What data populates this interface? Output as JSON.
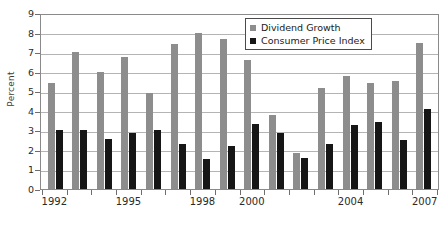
{
  "chart_data": {
    "type": "bar",
    "title": "",
    "xlabel": "",
    "ylabel": "Percent",
    "ylim": [
      0,
      9
    ],
    "ytick_values": [
      0,
      1,
      2,
      3,
      4,
      5,
      6,
      7,
      8,
      9
    ],
    "grid": true,
    "legend_position": "top-right",
    "categories": [
      "1992",
      "1993",
      "1994",
      "1995",
      "1996",
      "1997",
      "1998",
      "1999",
      "2000",
      "2001",
      "2002",
      "2003",
      "2004",
      "2005",
      "2006",
      "2007"
    ],
    "visible_xtick_labels": [
      "1992",
      "1995",
      "1998",
      "2000",
      "2004",
      "2007"
    ],
    "series": [
      {
        "name": "Dividend Growth",
        "color": "#8d8d8d",
        "values": [
          5.4,
          7.0,
          6.0,
          6.75,
          4.9,
          7.4,
          8.0,
          7.65,
          6.6,
          3.8,
          1.85,
          5.15,
          5.8,
          5.4,
          5.5,
          7.45
        ]
      },
      {
        "name": "Consumer Price Index",
        "color": "#161616",
        "values": [
          3.0,
          3.0,
          2.55,
          2.85,
          3.0,
          2.3,
          1.55,
          2.2,
          3.35,
          2.85,
          1.6,
          2.3,
          3.25,
          3.45,
          2.5,
          4.1
        ]
      }
    ]
  },
  "legend": {
    "items": [
      {
        "label": "Dividend Growth"
      },
      {
        "label": "Consumer Price Index"
      }
    ]
  }
}
